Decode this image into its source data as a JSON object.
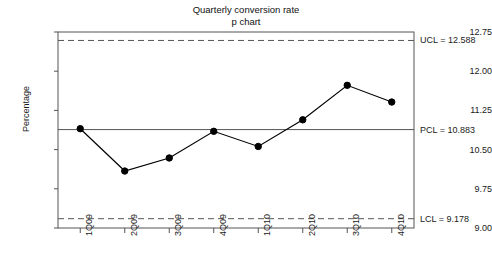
{
  "chart_data": {
    "type": "line",
    "title": "Quarterly conversion rate",
    "subtitle": "p chart",
    "xlabel": "",
    "ylabel": "Percentage",
    "categories": [
      "1Q09",
      "2Q09",
      "3Q09",
      "4Q09",
      "1Q10",
      "2Q10",
      "3Q10",
      "4Q10"
    ],
    "values": [
      10.9,
      10.09,
      10.34,
      10.85,
      10.56,
      11.07,
      11.73,
      11.41
    ],
    "series": [
      {
        "name": "Percentage",
        "values": [
          10.9,
          10.09,
          10.34,
          10.85,
          10.56,
          11.07,
          11.73,
          11.41
        ]
      }
    ],
    "ylim": [
      9.0,
      12.75
    ],
    "yticks": [
      12.75,
      12.0,
      11.25,
      10.5,
      9.75,
      9.0
    ],
    "ytick_labels": [
      "12.75",
      "12.00",
      "11.25",
      "10.50",
      "9.75",
      "9.00"
    ],
    "grid": false,
    "legend": "none",
    "marker": "filled-circle",
    "line_color": "#000000",
    "marker_color": "#000000",
    "control_lines": [
      {
        "id": "ucl",
        "label": "UCL = 12.588",
        "value": 12.588,
        "style": "dashed"
      },
      {
        "id": "pcl",
        "label": "PCL = 10.883",
        "value": 10.883,
        "style": "solid"
      },
      {
        "id": "lcl",
        "label": "LCL = 9.178",
        "value": 9.178,
        "style": "dashed"
      }
    ]
  }
}
